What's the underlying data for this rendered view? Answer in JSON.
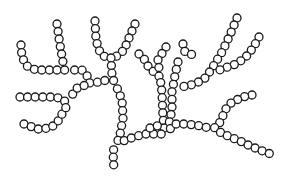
{
  "diagram": {
    "title": "",
    "bead_radius": 4,
    "bead_spacing": 7.6,
    "stroke_color": "#1a1a1a",
    "fill_color": "#ffffff",
    "background": "#ffffff",
    "chains": [
      {
        "name": "left-upper-hook",
        "points": [
          [
            21,
            45
          ],
          [
            22,
            57
          ],
          [
            27,
            66
          ],
          [
            36,
            70
          ],
          [
            60,
            70
          ],
          [
            67,
            70
          ]
        ]
      },
      {
        "name": "left-upper-vertical",
        "points": [
          [
            57,
            24
          ],
          [
            60,
            45
          ],
          [
            63,
            62
          ],
          [
            67,
            70
          ]
        ]
      },
      {
        "name": "left-upper-connector",
        "points": [
          [
            67,
            70
          ],
          [
            82,
            70
          ],
          [
            88,
            77
          ],
          [
            90,
            84
          ]
        ]
      },
      {
        "name": "top-center-left-arm",
        "points": [
          [
            95,
            21
          ],
          [
            96,
            40
          ],
          [
            99,
            50
          ],
          [
            103,
            56
          ],
          [
            111,
            58
          ]
        ]
      },
      {
        "name": "top-center-right-arm",
        "points": [
          [
            135,
            24
          ],
          [
            129,
            38
          ],
          [
            124,
            50
          ],
          [
            117,
            56
          ],
          [
            111,
            58
          ]
        ]
      },
      {
        "name": "center-trunk-upper",
        "points": [
          [
            111,
            58
          ],
          [
            112,
            75
          ],
          [
            114,
            82
          ]
        ]
      },
      {
        "name": "center-crossbar",
        "points": [
          [
            90,
            84
          ],
          [
            98,
            82
          ],
          [
            107,
            80
          ],
          [
            114,
            82
          ]
        ]
      },
      {
        "name": "left-middle-row",
        "points": [
          [
            20,
            97
          ],
          [
            55,
            97
          ],
          [
            62,
            99
          ],
          [
            68,
            104
          ]
        ]
      },
      {
        "name": "left-lower-hook",
        "points": [
          [
            24,
            124
          ],
          [
            38,
            129
          ],
          [
            50,
            128
          ],
          [
            57,
            123
          ],
          [
            62,
            114
          ],
          [
            68,
            104
          ],
          [
            72,
            95
          ],
          [
            78,
            87
          ],
          [
            90,
            84
          ]
        ]
      },
      {
        "name": "center-trunk-lower",
        "points": [
          [
            114,
            82
          ],
          [
            118,
            90
          ],
          [
            122,
            100
          ],
          [
            123,
            118
          ],
          [
            120,
            135
          ],
          [
            117,
            143
          ]
        ]
      },
      {
        "name": "bottom-tail",
        "points": [
          [
            117,
            143
          ],
          [
            113,
            151
          ],
          [
            114,
            172
          ]
        ]
      },
      {
        "name": "mid-left-branch",
        "points": [
          [
            139,
            54
          ],
          [
            145,
            60
          ],
          [
            149,
            68
          ],
          [
            154,
            72
          ],
          [
            160,
            77
          ]
        ]
      },
      {
        "name": "mid-spine-vertical",
        "points": [
          [
            166,
            47
          ],
          [
            158,
            60
          ],
          [
            160,
            77
          ],
          [
            162,
            92
          ],
          [
            163,
            117
          ],
          [
            165,
            134
          ]
        ]
      },
      {
        "name": "mid-lower-connector",
        "points": [
          [
            117,
            143
          ],
          [
            126,
            140
          ],
          [
            134,
            137
          ],
          [
            145,
            134
          ],
          [
            155,
            134
          ],
          [
            165,
            134
          ]
        ]
      },
      {
        "name": "mid-right-vertical",
        "points": [
          [
            178,
            62
          ],
          [
            175,
            75
          ],
          [
            172,
            92
          ],
          [
            172,
            110
          ],
          [
            168,
            128
          ],
          [
            165,
            134
          ]
        ]
      },
      {
        "name": "mid-right-upper",
        "points": [
          [
            183,
            44
          ],
          [
            185,
            52
          ],
          [
            196,
            56
          ]
        ]
      },
      {
        "name": "upper-right-arm",
        "points": [
          [
            237,
            18
          ],
          [
            230,
            35
          ],
          [
            222,
            52
          ],
          [
            211,
            70
          ],
          [
            205,
            78
          ],
          [
            195,
            84
          ],
          [
            181,
            87
          ]
        ]
      },
      {
        "name": "upper-right-join",
        "points": [
          [
            181,
            87
          ],
          [
            172,
            92
          ]
        ]
      },
      {
        "name": "right-arm",
        "points": [
          [
            259,
            37
          ],
          [
            253,
            48
          ],
          [
            245,
            58
          ],
          [
            236,
            64
          ],
          [
            225,
            68
          ],
          [
            214,
            72
          ]
        ]
      },
      {
        "name": "right-lower-arm",
        "points": [
          [
            252,
            95
          ],
          [
            243,
            97
          ],
          [
            232,
            102
          ],
          [
            225,
            110
          ],
          [
            222,
            118
          ],
          [
            218,
            126
          ],
          [
            212,
            129
          ]
        ]
      },
      {
        "name": "main-bottom-right",
        "points": [
          [
            165,
            134
          ],
          [
            175,
            124
          ],
          [
            185,
            124
          ],
          [
            195,
            125
          ],
          [
            205,
            127
          ],
          [
            212,
            129
          ],
          [
            222,
            133
          ],
          [
            230,
            137
          ],
          [
            240,
            141
          ],
          [
            250,
            146
          ],
          [
            260,
            150
          ],
          [
            276,
            156
          ]
        ]
      },
      {
        "name": "bottom-right-lower-row",
        "points": [
          [
            150,
            128
          ],
          [
            160,
            125
          ],
          [
            172,
            124
          ],
          [
            175,
            124
          ]
        ]
      }
    ]
  }
}
